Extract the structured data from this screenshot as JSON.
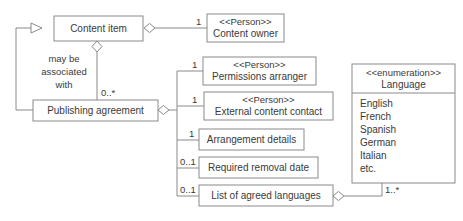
{
  "diagram": {
    "line_color": "#8a8a8a",
    "text_color": "#3a3a3a",
    "background_color": "#ffffff"
  },
  "classes": {
    "content_item": {
      "name": "Content item"
    },
    "publishing_agreement": {
      "name": "Publishing agreement"
    },
    "content_owner": {
      "stereotype": "<<Person>>",
      "name": "Content owner"
    },
    "permissions_arranger": {
      "stereotype": "<<Person>>",
      "name": "Permissions arranger"
    },
    "external_content_contact": {
      "stereotype": "<<Person>>",
      "name": "External content contact"
    },
    "arrangement_details": {
      "name": "Arrangement details"
    },
    "required_removal_date": {
      "name": "Required removal date"
    },
    "list_of_agreed_languages": {
      "name": "List of agreed languages"
    },
    "language_enum": {
      "stereotype": "<<enumeration>>",
      "name": "Language",
      "items": [
        "English",
        "French",
        "Spanish",
        "German",
        "Italian",
        "etc."
      ]
    }
  },
  "association_labels": {
    "may_be_associated_with": [
      "may be",
      "associated",
      "with"
    ]
  },
  "multiplicities": {
    "content_item_to_publishing_agreement": "0..*",
    "content_item_to_content_owner": "1",
    "pa_to_permissions_arranger": "1",
    "pa_to_external_content_contact": "1",
    "pa_to_arrangement_details": "1",
    "pa_to_required_removal_date": "0..1",
    "pa_to_list_of_agreed_languages": "0..1",
    "languages_to_language_enum": "1..*"
  }
}
